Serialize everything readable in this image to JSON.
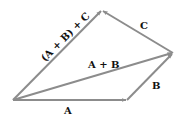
{
  "diagram": {
    "title": "",
    "colors": {
      "vector": "#8c8c8c",
      "label": "#111111",
      "background": "#ffffff"
    },
    "points": {
      "origin": [
        13,
        100
      ],
      "a_tip": [
        127,
        100
      ],
      "b_tip": [
        173,
        53
      ],
      "apex": [
        102,
        10
      ]
    },
    "vectors": [
      {
        "id": "A",
        "label": "A",
        "from": "origin",
        "to": "a_tip"
      },
      {
        "id": "B",
        "label": "B",
        "from": "a_tip",
        "to": "b_tip"
      },
      {
        "id": "A+B",
        "label": "A + B",
        "from": "origin",
        "to": "b_tip"
      },
      {
        "id": "C",
        "label": "C",
        "from": "b_tip",
        "to": "apex"
      },
      {
        "id": "(A+B)+C",
        "label": "(A + B) + C",
        "from": "origin",
        "to": "apex"
      }
    ],
    "labels": {
      "a": "A",
      "b": "B",
      "c": "C",
      "a_plus_b": "A + B",
      "sum": "(A + B) + C"
    }
  }
}
